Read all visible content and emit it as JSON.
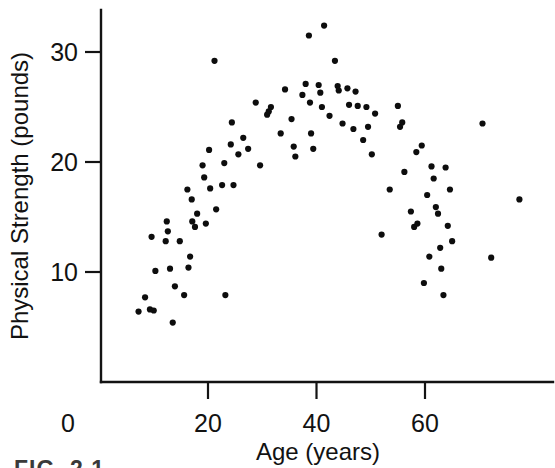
{
  "figure": {
    "caption_partial": "FIG. 2.1"
  },
  "axes": {
    "x_title": "Age (years)",
    "y_title": "Physical Strength (pounds)",
    "x_ticks": [
      "20",
      "40",
      "60"
    ],
    "x_tick_values": [
      20,
      40,
      60
    ],
    "y_ticks": [
      "10",
      "20",
      "30"
    ],
    "y_tick_values": [
      10,
      20,
      30
    ],
    "origin_label": "0"
  },
  "chart_data": {
    "type": "scatter",
    "title": "",
    "xlabel": "Age (years)",
    "ylabel": "Physical Strength (pounds)",
    "xlim": [
      0,
      80
    ],
    "ylim": [
      0,
      34
    ],
    "grid": false,
    "legend": false,
    "marker_color": "#0d0d0d",
    "marker_size": 3.1,
    "series": [
      {
        "name": "Subjects",
        "points": [
          [
            7.2,
            6.4
          ],
          [
            8.4,
            7.7
          ],
          [
            9.3,
            6.6
          ],
          [
            9.6,
            13.2
          ],
          [
            10.0,
            6.5
          ],
          [
            10.3,
            10.1
          ],
          [
            12.2,
            12.8
          ],
          [
            12.4,
            14.6
          ],
          [
            12.6,
            13.7
          ],
          [
            13.0,
            10.3
          ],
          [
            13.5,
            5.4
          ],
          [
            13.9,
            8.7
          ],
          [
            14.8,
            12.8
          ],
          [
            15.6,
            7.9
          ],
          [
            16.2,
            17.5
          ],
          [
            16.4,
            10.4
          ],
          [
            16.7,
            11.4
          ],
          [
            17.0,
            16.6
          ],
          [
            17.1,
            14.6
          ],
          [
            17.6,
            14.1
          ],
          [
            18.0,
            15.3
          ],
          [
            19.0,
            19.7
          ],
          [
            19.3,
            18.6
          ],
          [
            19.6,
            14.4
          ],
          [
            20.2,
            21.1
          ],
          [
            20.4,
            17.6
          ],
          [
            21.2,
            29.2
          ],
          [
            21.5,
            15.7
          ],
          [
            22.6,
            17.9
          ],
          [
            23.0,
            19.9
          ],
          [
            23.2,
            7.9
          ],
          [
            24.2,
            21.6
          ],
          [
            24.4,
            23.6
          ],
          [
            24.7,
            17.9
          ],
          [
            25.6,
            20.7
          ],
          [
            26.5,
            22.2
          ],
          [
            27.4,
            21.2
          ],
          [
            28.8,
            25.4
          ],
          [
            29.6,
            19.7
          ],
          [
            30.9,
            24.3
          ],
          [
            31.2,
            24.6
          ],
          [
            31.6,
            25.0
          ],
          [
            33.4,
            22.6
          ],
          [
            34.2,
            26.6
          ],
          [
            35.4,
            23.9
          ],
          [
            35.8,
            21.4
          ],
          [
            36.1,
            20.5
          ],
          [
            37.4,
            26.1
          ],
          [
            38.0,
            27.1
          ],
          [
            38.6,
            31.5
          ],
          [
            38.8,
            25.4
          ],
          [
            39.0,
            22.6
          ],
          [
            39.4,
            21.2
          ],
          [
            40.4,
            27.0
          ],
          [
            40.7,
            26.3
          ],
          [
            41.0,
            25.0
          ],
          [
            41.4,
            32.4
          ],
          [
            42.4,
            24.2
          ],
          [
            43.4,
            29.2
          ],
          [
            43.9,
            26.9
          ],
          [
            44.1,
            26.5
          ],
          [
            44.8,
            23.5
          ],
          [
            45.7,
            26.7
          ],
          [
            46.0,
            25.2
          ],
          [
            46.8,
            23.0
          ],
          [
            47.2,
            26.4
          ],
          [
            47.6,
            25.1
          ],
          [
            48.6,
            22.0
          ],
          [
            49.2,
            25.0
          ],
          [
            49.5,
            23.2
          ],
          [
            50.2,
            20.7
          ],
          [
            50.8,
            24.4
          ],
          [
            52.0,
            13.4
          ],
          [
            53.5,
            17.5
          ],
          [
            55.4,
            23.2
          ],
          [
            55.8,
            23.6
          ],
          [
            56.2,
            19.1
          ],
          [
            57.4,
            15.5
          ],
          [
            58.0,
            14.1
          ],
          [
            58.4,
            20.9
          ],
          [
            58.6,
            14.4
          ],
          [
            59.4,
            21.5
          ],
          [
            59.8,
            9.0
          ],
          [
            60.4,
            17.0
          ],
          [
            60.8,
            11.4
          ],
          [
            61.2,
            19.6
          ],
          [
            61.6,
            18.5
          ],
          [
            62.0,
            15.9
          ],
          [
            62.4,
            15.3
          ],
          [
            62.8,
            12.2
          ],
          [
            63.0,
            10.3
          ],
          [
            63.4,
            7.9
          ],
          [
            63.8,
            19.5
          ],
          [
            64.2,
            14.2
          ],
          [
            64.6,
            17.5
          ],
          [
            65.0,
            12.8
          ],
          [
            70.6,
            23.5
          ],
          [
            72.2,
            11.3
          ],
          [
            77.4,
            16.6
          ],
          [
            55.0,
            25.1
          ]
        ]
      }
    ]
  }
}
